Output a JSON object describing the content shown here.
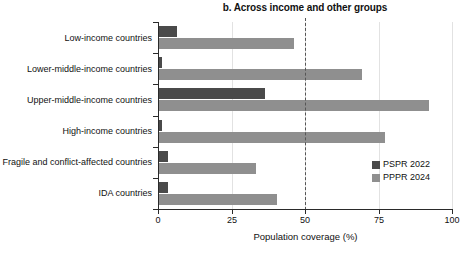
{
  "chart_data": {
    "type": "bar",
    "orientation": "horizontal",
    "title": "b. Across income and other groups",
    "xlabel": "Population coverage (%)",
    "ylabel": "",
    "xlim": [
      0,
      100
    ],
    "xticks": [
      0,
      25,
      50,
      75,
      100
    ],
    "xticklabels": [
      "0",
      "25",
      "50",
      "75",
      "100"
    ],
    "grid": true,
    "legend_position": "middle-right",
    "reference_line": {
      "value": 50,
      "style": "dashed"
    },
    "categories": [
      "Low-income countries",
      "Lower-middle-income countries",
      "Upper-middle-income countries",
      "High-income countries",
      "Fragile and conflict-affected countries",
      "IDA countries"
    ],
    "series": [
      {
        "name": "PSPR 2022",
        "color": "#4a4a4a",
        "values": [
          6,
          1,
          36,
          1,
          3,
          3
        ]
      },
      {
        "name": "PPPR 2024",
        "color": "#8f8f8f",
        "values": [
          46,
          69,
          92,
          77,
          33,
          40
        ]
      }
    ]
  },
  "legend": {
    "items": [
      {
        "label": "PSPR 2022",
        "color": "#4a4a4a"
      },
      {
        "label": "PPPR 2024",
        "color": "#8f8f8f"
      }
    ]
  }
}
